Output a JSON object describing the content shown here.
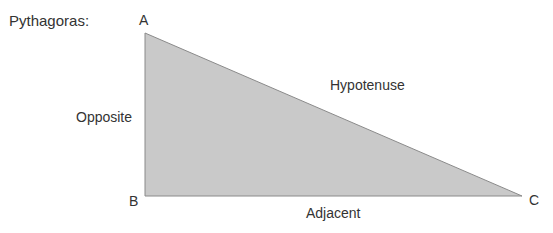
{
  "title": "Pythagoras:",
  "vertices": {
    "a": "A",
    "b": "B",
    "c": "C"
  },
  "sides": {
    "opposite": "Opposite",
    "hypotenuse": "Hypotenuse",
    "adjacent": "Adjacent"
  },
  "colors": {
    "fill": "#c9c9c9",
    "stroke": "#8a8a8a",
    "text": "#333333"
  }
}
